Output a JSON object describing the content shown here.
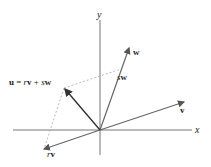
{
  "diagram": {
    "axes": {
      "x_label": "x",
      "y_label": "y"
    },
    "vectors": {
      "w": {
        "label": "w"
      },
      "sw": {
        "label_scalar": "s",
        "label_vec": "w"
      },
      "v": {
        "label": "v"
      },
      "rv": {
        "label_scalar": "r",
        "label_vec": "v"
      },
      "u": {
        "label_vec": "u",
        "equals": " = ",
        "r": "r",
        "v": "v",
        "plus": " + ",
        "s": "s",
        "w": "w"
      }
    },
    "colors": {
      "axis": "#666666",
      "vector": "#555555",
      "u_vector": "#333333",
      "dashed": "#aaaaaa",
      "text": "#222222"
    }
  }
}
